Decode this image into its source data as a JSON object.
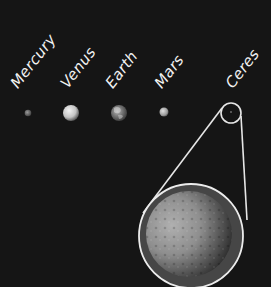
{
  "background_color": "#151515",
  "planets": [
    {
      "name": "Mercury",
      "label": "Mercury",
      "cx": 28,
      "cy": 113,
      "r": 3.2,
      "color": "#8c8c8c"
    },
    {
      "name": "Venus",
      "label": "Venus",
      "cx": 71,
      "cy": 113,
      "r": 8,
      "color": "#d6d6d6"
    },
    {
      "name": "Earth",
      "label": "Earth",
      "cx": 119,
      "cy": 113,
      "r": 8,
      "color": "#8a8a8a"
    },
    {
      "name": "Mars",
      "label": "Mars",
      "cx": 164,
      "cy": 112,
      "r": 4.5,
      "color": "#bdbdbd"
    },
    {
      "name": "Ceres",
      "label": "Ceres",
      "cx": 231,
      "cy": 112,
      "r": 1,
      "color": "#6a6a6a"
    }
  ],
  "zoom_inset": {
    "target": "Ceres",
    "small_circle": {
      "cx": 231,
      "cy": 113,
      "r": 10
    },
    "large_circle": {
      "cx": 191,
      "cy": 236,
      "r": 52
    },
    "planet_disc": {
      "cx": 189,
      "cy": 234,
      "r": 43
    },
    "stroke_color": "#e6e6e6"
  }
}
